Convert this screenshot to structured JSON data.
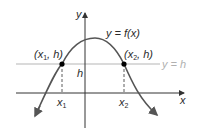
{
  "diagram": {
    "type": "function-graph",
    "function_label": "y = f(x)",
    "horizontal_line_label": "y = h",
    "axes": {
      "x_label": "x",
      "y_label": "y"
    },
    "points": [
      {
        "label_pre": "(x",
        "sub": "1",
        "label_post": ", h)",
        "x_label": "x",
        "x_sub": "1"
      },
      {
        "label_pre": "(x",
        "sub": "2",
        "label_post": ", h)",
        "x_label": "x",
        "x_sub": "2"
      }
    ],
    "h_label": "h",
    "colors": {
      "curve": "#555555",
      "axes": "#333333",
      "h_line": "#b5b5b5",
      "points": "#000000"
    }
  }
}
